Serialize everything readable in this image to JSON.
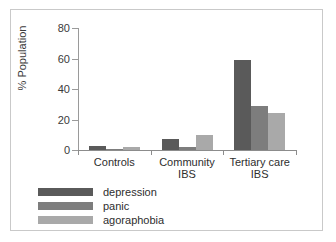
{
  "chart_data": {
    "type": "bar",
    "title": "",
    "xlabel": "",
    "ylabel": "% Population",
    "ylim": [
      0,
      80
    ],
    "yticks": [
      0,
      20,
      40,
      60,
      80
    ],
    "ytick_labels": [
      "0",
      "20",
      "40",
      "60",
      "80"
    ],
    "grid": false,
    "legend_position": "below-left",
    "categories": [
      "Controls",
      "Community IBS",
      "Tertiary care IBS"
    ],
    "category_lines": [
      [
        "Controls"
      ],
      [
        "Community",
        "IBS"
      ],
      [
        "Tertiary care",
        "IBS"
      ]
    ],
    "series": [
      {
        "name": "depression",
        "color": "#5a5a5a",
        "values": [
          2.5,
          7,
          59
        ]
      },
      {
        "name": "panic",
        "color": "#7d7d7d",
        "values": [
          0.5,
          2,
          29
        ]
      },
      {
        "name": "agoraphobia",
        "color": "#a9a9a9",
        "values": [
          2,
          10,
          24
        ]
      }
    ]
  },
  "axis": {
    "y_title": "% Population"
  },
  "legend": {
    "items": [
      {
        "label": "depression",
        "color": "#5a5a5a"
      },
      {
        "label": "panic",
        "color": "#7d7d7d"
      },
      {
        "label": "agoraphobia",
        "color": "#a9a9a9"
      }
    ]
  },
  "colors": {
    "frame": "#c9c9c9",
    "axis": "#8c8c8c",
    "background": "#ffffff",
    "text": "#2e2e2e"
  }
}
